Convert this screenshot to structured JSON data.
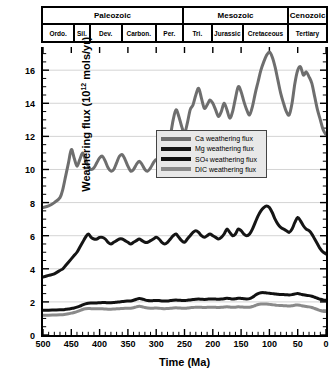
{
  "timescale": {
    "eras": [
      {
        "label": "Paleozoic",
        "start": 500,
        "end": 251
      },
      {
        "label": "Mesozoic",
        "start": 251,
        "end": 65
      },
      {
        "label": "Cenozoic",
        "start": 65,
        "end": 0
      }
    ],
    "periods": [
      {
        "label": "Ordo.",
        "start": 500,
        "end": 443
      },
      {
        "label": "Sil.",
        "start": 443,
        "end": 416
      },
      {
        "label": "Dev.",
        "start": 416,
        "end": 359
      },
      {
        "label": "Carbon.",
        "start": 359,
        "end": 299
      },
      {
        "label": "Per.",
        "start": 299,
        "end": 251
      },
      {
        "label": "Tri.",
        "start": 251,
        "end": 200
      },
      {
        "label": "Jurassic",
        "start": 200,
        "end": 145
      },
      {
        "label": "Cretaceous",
        "start": 145,
        "end": 65
      },
      {
        "label": "Tertiary",
        "start": 65,
        "end": 0
      }
    ]
  },
  "chart_data": {
    "type": "line",
    "title": "",
    "xlabel": "Time (Ma)",
    "ylabel": "Weathering flux (10¹² mols/yr)",
    "ylabel_prefix": "Weathering flux (10",
    "ylabel_exp": "12",
    "ylabel_suffix": " mols/yr)",
    "xlim": [
      500,
      0
    ],
    "ylim": [
      0,
      17.4
    ],
    "x_ticks": [
      500,
      450,
      400,
      350,
      300,
      250,
      200,
      150,
      100,
      50,
      0
    ],
    "x_minor_step": 10,
    "y_ticks": [
      0,
      2,
      4,
      6,
      8,
      10,
      12,
      14,
      16
    ],
    "y_minor_step": 0.5,
    "grid": "horizontal-major",
    "x_inverted": true,
    "legend_position": "center",
    "series": [
      {
        "name": "Ca weathering flux",
        "color": "#6e6e6e",
        "x": [
          500,
          490,
          480,
          470,
          465,
          460,
          455,
          450,
          445,
          440,
          435,
          430,
          425,
          420,
          415,
          410,
          405,
          400,
          395,
          390,
          385,
          380,
          375,
          370,
          365,
          360,
          355,
          350,
          345,
          340,
          335,
          330,
          325,
          320,
          315,
          310,
          305,
          300,
          295,
          290,
          285,
          280,
          275,
          270,
          265,
          260,
          255,
          250,
          245,
          240,
          235,
          230,
          225,
          220,
          215,
          210,
          205,
          200,
          195,
          190,
          185,
          180,
          175,
          170,
          165,
          160,
          155,
          150,
          145,
          140,
          135,
          130,
          125,
          120,
          115,
          110,
          105,
          100,
          95,
          90,
          85,
          80,
          75,
          70,
          65,
          60,
          55,
          50,
          45,
          40,
          35,
          30,
          25,
          20,
          15,
          10,
          5,
          0
        ],
        "y": [
          7.7,
          7.8,
          8.0,
          8.3,
          8.8,
          9.6,
          10.4,
          11.2,
          10.7,
          10.2,
          10.6,
          11.0,
          10.6,
          10.2,
          10.0,
          10.1,
          10.4,
          10.7,
          10.8,
          10.5,
          10.1,
          9.9,
          10.0,
          10.4,
          10.8,
          10.9,
          10.6,
          10.2,
          9.9,
          10.0,
          10.3,
          10.5,
          10.3,
          10.0,
          9.9,
          10.1,
          10.4,
          10.6,
          10.4,
          10.1,
          10.3,
          11.0,
          12.0,
          13.0,
          13.6,
          13.2,
          12.6,
          12.2,
          12.8,
          13.6,
          13.9,
          14.5,
          14.9,
          14.3,
          13.7,
          13.9,
          14.2,
          14.0,
          13.6,
          13.2,
          13.5,
          14.0,
          13.6,
          13.1,
          13.5,
          14.3,
          15.0,
          14.7,
          14.1,
          13.6,
          13.3,
          13.8,
          14.6,
          15.3,
          16.0,
          16.5,
          16.9,
          17.1,
          16.8,
          16.2,
          15.4,
          14.6,
          14.0,
          13.5,
          13.3,
          14.0,
          15.2,
          16.0,
          16.2,
          15.7,
          15.9,
          15.6,
          15.2,
          14.4,
          13.6,
          13.0,
          12.4,
          12.1
        ]
      },
      {
        "name": "Mg weathering flux",
        "color": "#151515",
        "x": [
          500,
          490,
          480,
          470,
          465,
          460,
          455,
          450,
          445,
          440,
          435,
          430,
          425,
          420,
          415,
          410,
          405,
          400,
          395,
          390,
          385,
          380,
          375,
          370,
          365,
          360,
          355,
          350,
          345,
          340,
          335,
          330,
          325,
          320,
          315,
          310,
          305,
          300,
          295,
          290,
          285,
          280,
          275,
          270,
          265,
          260,
          255,
          250,
          245,
          240,
          235,
          230,
          225,
          220,
          215,
          210,
          205,
          200,
          195,
          190,
          185,
          180,
          175,
          170,
          165,
          160,
          155,
          150,
          145,
          140,
          135,
          130,
          125,
          120,
          115,
          110,
          105,
          100,
          95,
          90,
          85,
          80,
          75,
          70,
          65,
          60,
          55,
          50,
          45,
          40,
          35,
          30,
          25,
          20,
          15,
          10,
          5,
          0
        ],
        "y": [
          3.5,
          3.6,
          3.7,
          3.9,
          4.0,
          4.2,
          4.4,
          4.6,
          4.8,
          5.0,
          5.3,
          5.6,
          5.9,
          6.1,
          5.9,
          5.8,
          5.8,
          5.9,
          5.9,
          5.8,
          5.6,
          5.5,
          5.6,
          5.7,
          5.8,
          5.8,
          5.7,
          5.6,
          5.5,
          5.6,
          5.7,
          5.8,
          5.7,
          5.6,
          5.6,
          5.7,
          5.8,
          5.9,
          5.8,
          5.6,
          5.5,
          5.6,
          5.8,
          6.0,
          6.1,
          5.9,
          5.7,
          5.6,
          5.8,
          6.0,
          6.2,
          6.3,
          6.2,
          6.0,
          5.9,
          6.0,
          6.1,
          6.0,
          5.9,
          5.8,
          5.9,
          6.1,
          6.4,
          6.2,
          6.0,
          6.1,
          6.4,
          6.3,
          6.1,
          6.0,
          6.1,
          6.4,
          6.8,
          7.2,
          7.5,
          7.7,
          7.8,
          7.7,
          7.4,
          7.0,
          6.7,
          6.5,
          6.4,
          6.3,
          6.2,
          6.4,
          6.8,
          7.1,
          6.9,
          6.6,
          6.4,
          6.3,
          6.1,
          5.8,
          5.5,
          5.2,
          5.0,
          4.9
        ]
      },
      {
        "name": "SO4 weathering flux",
        "label_main": "SO",
        "label_sub": "4",
        "label_rest": " weathering flux",
        "color": "#111111",
        "x": [
          500,
          490,
          480,
          470,
          465,
          460,
          455,
          450,
          445,
          440,
          435,
          430,
          425,
          420,
          415,
          410,
          405,
          400,
          395,
          390,
          385,
          380,
          375,
          370,
          365,
          360,
          355,
          350,
          345,
          340,
          335,
          330,
          325,
          320,
          315,
          310,
          305,
          300,
          295,
          290,
          285,
          280,
          275,
          270,
          265,
          260,
          255,
          250,
          245,
          240,
          235,
          230,
          225,
          220,
          215,
          210,
          205,
          200,
          195,
          190,
          185,
          180,
          175,
          170,
          165,
          160,
          155,
          150,
          145,
          140,
          135,
          130,
          125,
          120,
          115,
          110,
          105,
          100,
          95,
          90,
          85,
          80,
          75,
          70,
          65,
          60,
          55,
          50,
          45,
          40,
          35,
          30,
          25,
          20,
          15,
          10,
          5,
          0
        ],
        "y": [
          1.5,
          1.5,
          1.51,
          1.52,
          1.53,
          1.55,
          1.57,
          1.6,
          1.63,
          1.68,
          1.74,
          1.82,
          1.88,
          1.92,
          1.93,
          1.93,
          1.94,
          1.95,
          1.96,
          1.96,
          1.95,
          1.95,
          1.96,
          1.98,
          2.0,
          2.02,
          2.04,
          2.05,
          2.06,
          2.1,
          2.16,
          2.2,
          2.18,
          2.12,
          2.08,
          2.07,
          2.08,
          2.09,
          2.08,
          2.06,
          2.05,
          2.06,
          2.08,
          2.1,
          2.11,
          2.1,
          2.09,
          2.08,
          2.1,
          2.12,
          2.14,
          2.16,
          2.17,
          2.16,
          2.15,
          2.16,
          2.18,
          2.18,
          2.17,
          2.16,
          2.17,
          2.19,
          2.22,
          2.2,
          2.18,
          2.19,
          2.22,
          2.21,
          2.19,
          2.18,
          2.2,
          2.28,
          2.4,
          2.5,
          2.55,
          2.56,
          2.54,
          2.52,
          2.5,
          2.48,
          2.46,
          2.45,
          2.44,
          2.43,
          2.42,
          2.44,
          2.48,
          2.5,
          2.47,
          2.43,
          2.4,
          2.38,
          2.34,
          2.28,
          2.22,
          2.16,
          2.12,
          2.1
        ]
      },
      {
        "name": "DIC weathering flux",
        "color": "#8a8a8a",
        "x": [
          500,
          490,
          480,
          470,
          465,
          460,
          455,
          450,
          445,
          440,
          435,
          430,
          425,
          420,
          415,
          410,
          405,
          400,
          395,
          390,
          385,
          380,
          375,
          370,
          365,
          360,
          355,
          350,
          345,
          340,
          335,
          330,
          325,
          320,
          315,
          310,
          305,
          300,
          295,
          290,
          285,
          280,
          275,
          270,
          265,
          260,
          255,
          250,
          245,
          240,
          235,
          230,
          225,
          220,
          215,
          210,
          205,
          200,
          195,
          190,
          185,
          180,
          175,
          170,
          165,
          160,
          155,
          150,
          145,
          140,
          135,
          130,
          125,
          120,
          115,
          110,
          105,
          100,
          95,
          90,
          85,
          80,
          75,
          70,
          65,
          60,
          55,
          50,
          45,
          40,
          35,
          30,
          25,
          20,
          15,
          10,
          5,
          0
        ],
        "y": [
          1.2,
          1.2,
          1.21,
          1.22,
          1.23,
          1.25,
          1.28,
          1.32,
          1.36,
          1.41,
          1.47,
          1.54,
          1.58,
          1.6,
          1.59,
          1.58,
          1.58,
          1.58,
          1.58,
          1.57,
          1.56,
          1.56,
          1.57,
          1.58,
          1.59,
          1.6,
          1.61,
          1.61,
          1.62,
          1.65,
          1.7,
          1.73,
          1.71,
          1.66,
          1.63,
          1.62,
          1.62,
          1.63,
          1.62,
          1.6,
          1.59,
          1.6,
          1.61,
          1.63,
          1.64,
          1.63,
          1.62,
          1.61,
          1.63,
          1.65,
          1.66,
          1.68,
          1.68,
          1.67,
          1.66,
          1.67,
          1.68,
          1.68,
          1.67,
          1.66,
          1.67,
          1.69,
          1.71,
          1.69,
          1.67,
          1.68,
          1.7,
          1.69,
          1.68,
          1.67,
          1.68,
          1.72,
          1.78,
          1.84,
          1.87,
          1.88,
          1.87,
          1.85,
          1.83,
          1.81,
          1.79,
          1.78,
          1.77,
          1.76,
          1.75,
          1.77,
          1.8,
          1.82,
          1.79,
          1.75,
          1.72,
          1.7,
          1.66,
          1.6,
          1.54,
          1.48,
          1.44,
          1.42
        ]
      }
    ]
  }
}
